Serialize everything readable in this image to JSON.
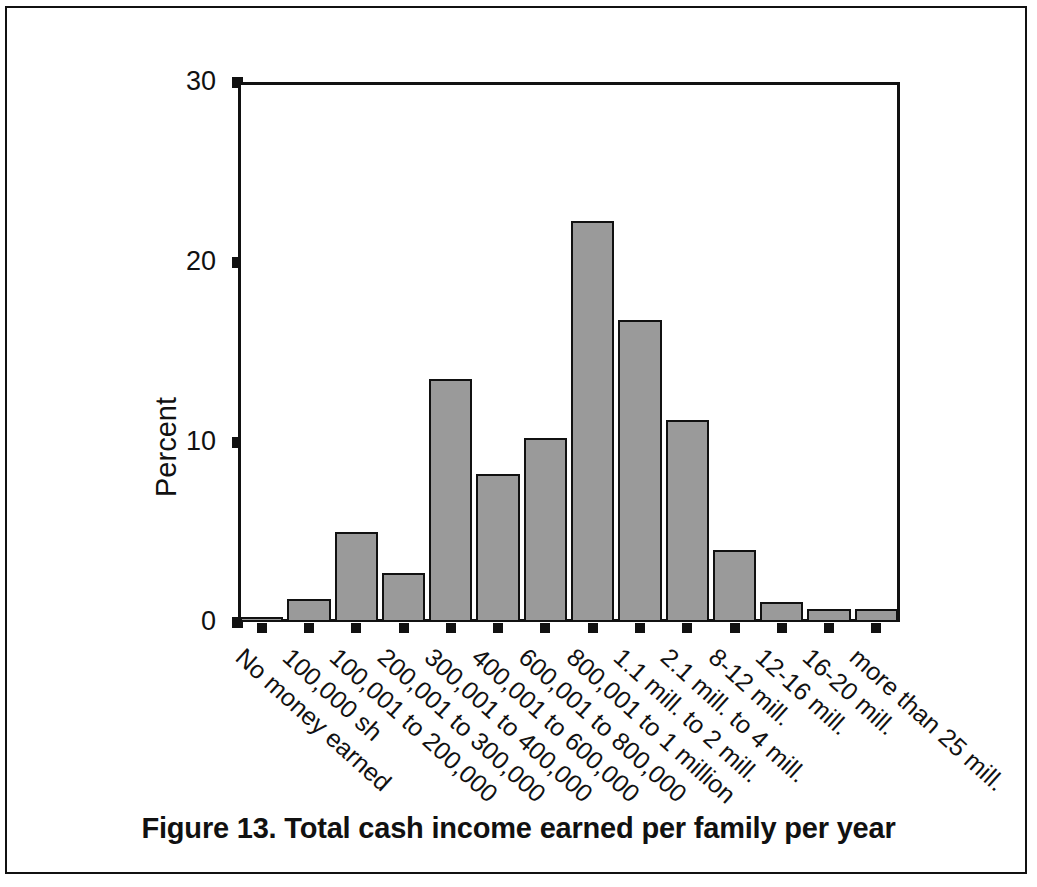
{
  "figure": {
    "caption": "Figure 13. Total cash income earned per family per year"
  },
  "chart_data": {
    "type": "bar",
    "title": "Figure 13. Total cash income earned per family per year",
    "xlabel": "",
    "ylabel": "Percent",
    "ylim": [
      0,
      30
    ],
    "yticks": [
      "0",
      "10",
      "20",
      "30"
    ],
    "grid": false,
    "legend": null,
    "bar_color": "#9a9a9a",
    "bar_edge_color": "#111111",
    "categories": [
      "No money earned",
      "100,000 sh",
      "100,001 to 200,000",
      "200,001 to 300,000",
      "300,001 to 400,000",
      "400,001 to 600,000",
      "600,001 to 800,000",
      "800,001 to 1 million",
      "1.1 mill. to 2 mill.",
      "2.1 mill. to 4 mill.",
      "8-12 mill.",
      "12-16 mill.",
      "16-20 mill.",
      "more than 25 mill."
    ],
    "values": [
      0.3,
      1.3,
      5.0,
      2.7,
      13.5,
      8.2,
      10.2,
      22.3,
      16.8,
      11.2,
      4.0,
      1.1,
      0.7,
      0.7
    ]
  }
}
